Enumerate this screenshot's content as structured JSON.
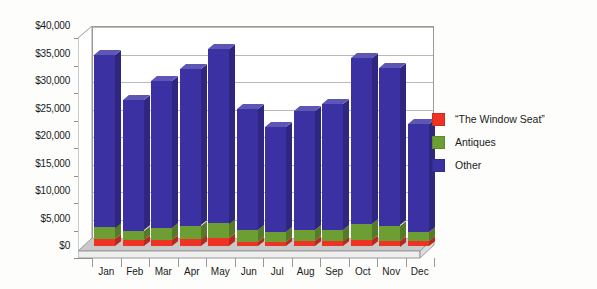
{
  "chart_data": {
    "type": "bar",
    "subtype": "stacked-column-3d",
    "title": "",
    "xlabel": "",
    "ylabel": "",
    "ylim": [
      0,
      40000
    ],
    "ytick_step": 5000,
    "grid": true,
    "legend_position": "right",
    "categories": [
      "Jan",
      "Feb",
      "Mar",
      "Apr",
      "May",
      "Jun",
      "Jul",
      "Aug",
      "Sep",
      "Oct",
      "Nov",
      "Dec"
    ],
    "ytick_labels": [
      "$40,000",
      "$35,000",
      "$30,000",
      "$25,000",
      "$20,000",
      "$15,000",
      "$10,000",
      "$5,000",
      "$0"
    ],
    "ytick_values": [
      40000,
      35000,
      30000,
      25000,
      20000,
      15000,
      10000,
      5000,
      0
    ],
    "series": [
      {
        "name": "“The Window Seat”",
        "color": "#ee3325",
        "values": [
          1300,
          1100,
          1100,
          1200,
          1400,
          800,
          700,
          900,
          900,
          1100,
          1000,
          900
        ]
      },
      {
        "name": "Antiques",
        "color": "#6d9e33",
        "values": [
          2100,
          1700,
          2200,
          2500,
          2700,
          2100,
          1800,
          2000,
          2100,
          2900,
          2700,
          1600
        ]
      },
      {
        "name": "Other",
        "color": "#3b31a3",
        "values": [
          31400,
          23700,
          26700,
          28400,
          31800,
          22000,
          19100,
          21700,
          22900,
          30100,
          28600,
          19600
        ]
      }
    ],
    "totals": [
      34800,
      26500,
      30000,
      32100,
      35900,
      24900,
      21600,
      24600,
      25900,
      34100,
      32300,
      22100
    ]
  },
  "legend": {
    "items": [
      {
        "label": "“The Window Seat”",
        "color": "#ee3325"
      },
      {
        "label": "Antiques",
        "color": "#6d9e33"
      },
      {
        "label": "Other",
        "color": "#3b31a3"
      }
    ]
  },
  "colors": {
    "series_window_seat": "#ee3325",
    "series_antiques": "#6d9e33",
    "series_other": "#3b31a3",
    "plot_background": "#ffffff",
    "page_background": "#fdfdfb",
    "gridline": "#b9b9b9",
    "axis": "#8d8d8d"
  }
}
